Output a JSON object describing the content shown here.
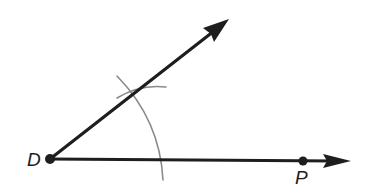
{
  "diagram": {
    "points": [
      {
        "id": "D",
        "label": "D",
        "x": 50,
        "y": 159
      },
      {
        "id": "P",
        "label": "P",
        "x": 303,
        "y": 161
      }
    ],
    "rays": [
      {
        "id": "ray-DP",
        "from": "D",
        "through": "P",
        "end": [
          350,
          161
        ]
      },
      {
        "id": "ray-upper",
        "from": "D",
        "end": [
          228,
          20
        ]
      }
    ],
    "arcs": [
      {
        "id": "large-arc",
        "center": "D",
        "description": "arc centered at D crossing both rays"
      },
      {
        "id": "small-arc",
        "description": "short arc intersecting the upper ray"
      }
    ],
    "colors": {
      "ray": "#1e1e1e",
      "arc": "#8a8a8a",
      "background": "#ffffff"
    }
  }
}
